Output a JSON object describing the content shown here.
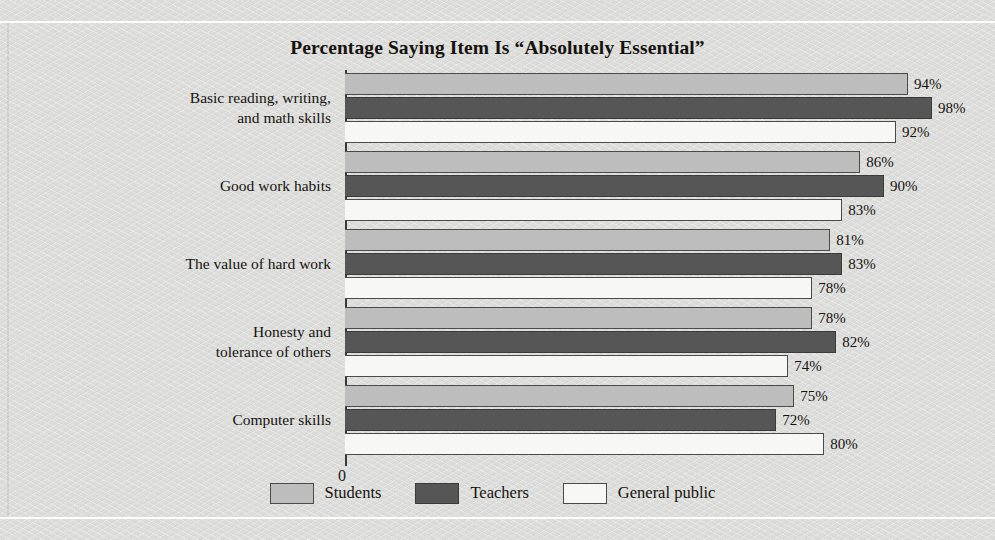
{
  "chart_data": {
    "type": "bar",
    "orientation": "horizontal",
    "title": "Percentage Saying Item Is “Absolutely Essential”",
    "xlabel": "",
    "ylabel": "",
    "axis_origin_label": "0",
    "xlim": [
      0,
      100
    ],
    "grid": false,
    "legend_position": "bottom-center",
    "value_suffix": "%",
    "categories": [
      "Basic reading, writing,\nand math skills",
      "Good work habits",
      "The value of hard work",
      "Honesty and\ntolerance of others",
      "Computer skills"
    ],
    "series": [
      {
        "name": "Students",
        "color": "#bdbdbd",
        "values": [
          94,
          86,
          81,
          78,
          75
        ],
        "labels": [
          "94%",
          "86%",
          "81%",
          "78%",
          "75%"
        ]
      },
      {
        "name": "Teachers",
        "color": "#565656",
        "values": [
          98,
          90,
          83,
          82,
          72
        ],
        "labels": [
          "98%",
          "90%",
          "83%",
          "82%",
          "72%"
        ]
      },
      {
        "name": "General public",
        "color": "#f7f7f5",
        "values": [
          92,
          83,
          78,
          74,
          80
        ],
        "labels": [
          "92%",
          "83%",
          "78%",
          "74%",
          "80%"
        ]
      }
    ]
  },
  "chart": {
    "title": "Percentage Saying Item Is “Absolutely Essential”",
    "zero_label": "0",
    "categories": [
      {
        "line1": "Basic reading, writing,",
        "line2": "and math skills"
      },
      {
        "line1": "Good work habits",
        "line2": ""
      },
      {
        "line1": "The value of hard work",
        "line2": ""
      },
      {
        "line1": "Honesty and",
        "line2": "tolerance of others"
      },
      {
        "line1": "Computer skills",
        "line2": ""
      }
    ],
    "legend": [
      {
        "label": "Students",
        "key": "students"
      },
      {
        "label": "Teachers",
        "key": "teachers"
      },
      {
        "label": "General public",
        "key": "general"
      }
    ],
    "groups": [
      {
        "bars": [
          {
            "series": "students",
            "label": "94%",
            "value": 94
          },
          {
            "series": "teachers",
            "label": "98%",
            "value": 98
          },
          {
            "series": "general",
            "label": "92%",
            "value": 92
          }
        ]
      },
      {
        "bars": [
          {
            "series": "students",
            "label": "86%",
            "value": 86
          },
          {
            "series": "teachers",
            "label": "90%",
            "value": 90
          },
          {
            "series": "general",
            "label": "83%",
            "value": 83
          }
        ]
      },
      {
        "bars": [
          {
            "series": "students",
            "label": "81%",
            "value": 81
          },
          {
            "series": "teachers",
            "label": "83%",
            "value": 83
          },
          {
            "series": "general",
            "label": "78%",
            "value": 78
          }
        ]
      },
      {
        "bars": [
          {
            "series": "students",
            "label": "78%",
            "value": 78
          },
          {
            "series": "teachers",
            "label": "82%",
            "value": 82
          },
          {
            "series": "general",
            "label": "74%",
            "value": 74
          }
        ]
      },
      {
        "bars": [
          {
            "series": "students",
            "label": "75%",
            "value": 75
          },
          {
            "series": "teachers",
            "label": "72%",
            "value": 72
          },
          {
            "series": "general",
            "label": "80%",
            "value": 80
          }
        ]
      }
    ]
  }
}
